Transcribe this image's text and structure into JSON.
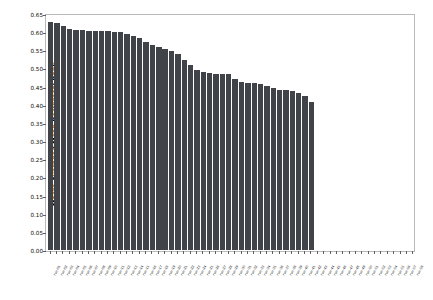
{
  "chart_data": {
    "type": "bar",
    "title": "",
    "subtitle": "",
    "xlabel": "",
    "ylabel": "Macro Averaged Mean Reciprocal Rank",
    "ylim": [
      0.0,
      0.65
    ],
    "ytick_labels": [
      "0.00",
      "0.05",
      "0.10",
      "0.15",
      "0.20",
      "0.25",
      "0.30",
      "0.35",
      "0.40",
      "0.45",
      "0.50",
      "0.55",
      "0.60",
      "0.65"
    ],
    "ytick_values": [
      0.0,
      0.05,
      0.1,
      0.15,
      0.2,
      0.25,
      0.3,
      0.35,
      0.4,
      0.45,
      0.5,
      0.55,
      0.6,
      0.65
    ],
    "grid": false,
    "legend": null,
    "legend_position": "none",
    "bar_color": "#404348",
    "categories": [
      "run-01",
      "run-02",
      "run-03",
      "run-04",
      "run-05",
      "run-06",
      "run-07",
      "run-08",
      "run-09",
      "run-10",
      "run-11",
      "run-12",
      "run-13",
      "run-14",
      "run-15",
      "run-16",
      "run-17",
      "run-18",
      "run-19",
      "run-20",
      "run-21",
      "run-22",
      "run-23",
      "run-24",
      "run-25",
      "run-26",
      "run-27",
      "run-28",
      "run-29",
      "run-30",
      "run-31",
      "run-32",
      "run-33",
      "run-34",
      "run-35",
      "run-36",
      "run-37",
      "run-38",
      "run-39",
      "run-40",
      "run-41",
      "run-42",
      "run-43",
      "run-44",
      "run-45",
      "run-46",
      "run-47",
      "run-48",
      "run-49",
      "run-50",
      "run-51",
      "run-52",
      "run-53",
      "run-54",
      "run-55",
      "run-56",
      "run-57",
      "run-58"
    ],
    "values": [
      0.628,
      0.624,
      0.617,
      0.61,
      0.607,
      0.605,
      0.604,
      0.604,
      0.603,
      0.602,
      0.601,
      0.6,
      0.596,
      0.589,
      0.583,
      0.574,
      0.565,
      0.558,
      0.553,
      0.549,
      0.541,
      0.524,
      0.509,
      0.497,
      0.489,
      0.487,
      0.486,
      0.486,
      0.485,
      0.471,
      0.464,
      0.46,
      0.459,
      0.457,
      0.451,
      0.446,
      0.442,
      0.44,
      0.438,
      0.432,
      0.425,
      0.407,
      0.0,
      0.0,
      0.0,
      0.0,
      0.0,
      0.0,
      0.0,
      0.0,
      0.0,
      0.0,
      0.0,
      0.0,
      0.0,
      0.0,
      0.0,
      0.0
    ]
  }
}
